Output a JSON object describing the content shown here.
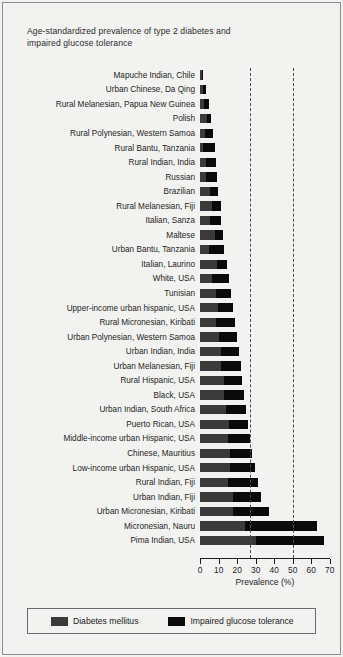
{
  "title": {
    "line1": "Age-standardized prevalence of type 2 diabetes and",
    "line2": "impaired glucose tolerance"
  },
  "axis": {
    "xlabel": "Prevalence (%)",
    "ticks": [
      "0",
      "10",
      "20",
      "30",
      "40",
      "50",
      "60",
      "70"
    ]
  },
  "legend": {
    "diabetes_label": "Diabetes mellitus",
    "igt_label": "Impaired glucose tolerance",
    "diabetes_color": "#3a3a3a",
    "igt_color": "#0a0a0a"
  },
  "chart_data": {
    "type": "bar",
    "orientation": "horizontal",
    "stacked": true,
    "title": "Age-standardized prevalence of type 2 diabetes and impaired glucose tolerance",
    "xlabel": "Prevalence (%)",
    "ylabel": "",
    "xlim": [
      0,
      70
    ],
    "xticks": [
      0,
      10,
      20,
      30,
      40,
      50,
      60,
      70
    ],
    "grid": false,
    "legend_position": "bottom",
    "reference_lines": [
      27,
      50
    ],
    "categories": [
      "Mapuche Indian, Chile",
      "Urban Chinese, Da Qing",
      "Rural Melanesian, Papua New Guinea",
      "Polish",
      "Rural Polynesian, Western Samoa",
      "Rural Bantu, Tanzania",
      "Rural Indian, India",
      "Russian",
      "Brazilian",
      "Rural Melanesian, Fiji",
      "Italian, Sanza",
      "Maltese",
      "Urban Bantu, Tanzania",
      "Italian, Laurino",
      "White, USA",
      "Tunisian",
      "Upper-income urban hispanic, USA",
      "Rural Micronesian, Kiribati",
      "Urban Polynesian, Western Samoa",
      "Urban Indian, India",
      "Urban Melanesian, Fiji",
      "Rural Hispanic, USA",
      "Black, USA",
      "Urban Indian, South Africa",
      "Puerto Rican, USA",
      "Middle-income urban Hispanic, USA",
      "Chinese, Mauritius",
      "Low-income urban Hispanic, USA",
      "Rural Indian, Fiji",
      "Urban Indian, Fiji",
      "Urban Micronesian, Kiribati",
      "Micronesian, Nauru",
      "Pima Indian, USA"
    ],
    "series": [
      {
        "name": "Diabetes mellitus",
        "color": "#3a3a3a",
        "values": [
          1.0,
          1.5,
          2.0,
          3.5,
          2.5,
          1.5,
          3.0,
          3.0,
          5.5,
          6.5,
          5.5,
          8.0,
          5.0,
          9.0,
          6.5,
          8.5,
          9.5,
          8.5,
          10.0,
          11.0,
          11.5,
          13.0,
          13.0,
          14.0,
          15.5,
          15.0,
          16.0,
          16.0,
          15.0,
          18.0,
          18.0,
          24.0,
          30.0
        ]
      },
      {
        "name": "Impaired glucose tolerance",
        "color": "#0a0a0a",
        "values": [
          0.5,
          1.5,
          2.5,
          2.5,
          4.5,
          6.5,
          5.5,
          6.0,
          4.0,
          4.5,
          6.0,
          4.5,
          8.0,
          5.5,
          9.0,
          8.0,
          8.5,
          10.5,
          10.0,
          10.0,
          10.5,
          9.5,
          10.5,
          11.0,
          10.5,
          12.0,
          12.0,
          13.5,
          16.0,
          15.0,
          19.0,
          39.0,
          37.0
        ]
      }
    ],
    "totals": [
      1.5,
      3.0,
      4.5,
      6.0,
      7.0,
      8.0,
      8.5,
      9.0,
      9.5,
      11.0,
      11.5,
      12.5,
      13.0,
      14.5,
      15.5,
      16.5,
      18.0,
      19.0,
      20.0,
      21.0,
      22.0,
      22.5,
      23.5,
      25.0,
      26.0,
      27.0,
      28.0,
      29.5,
      31.0,
      33.0,
      37.0,
      63.0,
      67.0
    ]
  }
}
